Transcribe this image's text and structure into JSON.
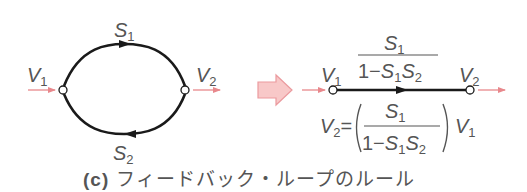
{
  "figure": {
    "caption_tag": "(c)",
    "caption_text": " フィードバック・ループのルール"
  },
  "left_graph": {
    "input_node": "V1",
    "output_node": "V2",
    "forward_branch": "S1",
    "feedback_branch": "S2"
  },
  "right_graph": {
    "input_node": "V1",
    "output_node": "V2",
    "branch_numerator": "S1",
    "branch_denominator": "1−S1S2"
  },
  "equation": {
    "lhs": "V2",
    "numerator": "S1",
    "denominator": "1−S1S2",
    "rhs_factor": "V1"
  },
  "colors": {
    "line": "#1a1a1a",
    "signal_arrow": "#e8888c",
    "block_arrow_fill": "#f8c8c8",
    "block_arrow_stroke": "#eb9a9e",
    "text": "#555555"
  }
}
